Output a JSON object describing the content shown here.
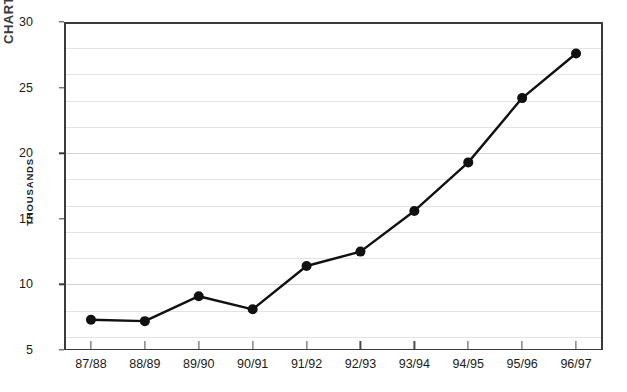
{
  "corner_artifact": {
    "text": "CHART"
  },
  "chart_data": {
    "type": "line",
    "title": "",
    "xlabel": "",
    "ylabel": "THOUSANDS",
    "categories": [
      "87/88",
      "88/89",
      "89/90",
      "90/91",
      "91/92",
      "92/93",
      "93/94",
      "94/95",
      "95/96",
      "96/97"
    ],
    "values": [
      7.3,
      7.2,
      9.1,
      8.1,
      11.4,
      12.5,
      15.6,
      19.3,
      24.2,
      27.6
    ],
    "series": [
      {
        "name": "Total",
        "values": [
          7.3,
          7.2,
          9.1,
          8.1,
          11.4,
          12.5,
          15.6,
          19.3,
          24.2,
          27.6
        ]
      }
    ],
    "ylim": [
      5,
      30
    ],
    "y_major_ticks": [
      5,
      10,
      15,
      20,
      25,
      30
    ],
    "y_tick_labels": [
      "5",
      "10",
      "15",
      "20",
      "25",
      "30"
    ],
    "y_gridlines": [
      6,
      8,
      10,
      12,
      14,
      16,
      18,
      20,
      22,
      24,
      26,
      28
    ],
    "y_tick_step": 5,
    "grid": true,
    "legend": "none",
    "marker": "filled-circle",
    "line_color": "#111111",
    "grid_color": "#e3e3e3",
    "axis_color": "#3a3a3a",
    "background_color": "#ffffff"
  }
}
